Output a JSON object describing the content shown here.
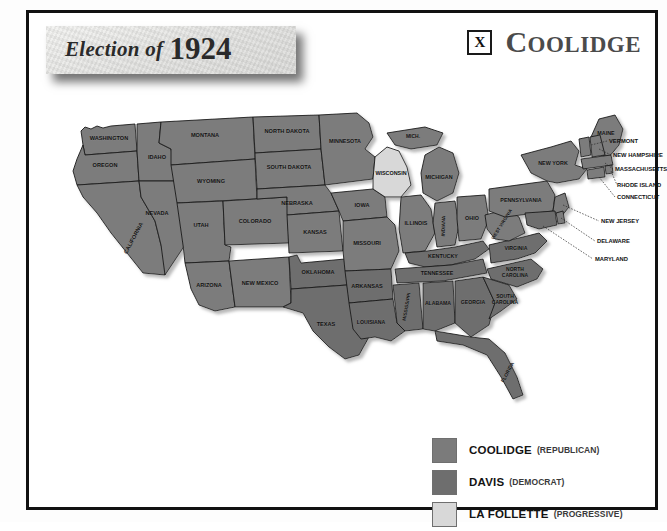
{
  "header": {
    "title_script": "Election of",
    "title_year": "1924",
    "winner_mark": "X",
    "winner_name": "Coolidge"
  },
  "legend": {
    "items": [
      {
        "name": "COOLIDGE",
        "party": "(REPUBLICAN)",
        "color": "#7b7b7b"
      },
      {
        "name": "DAVIS",
        "party": "(DEMOCRAT)",
        "color": "#6e6e6e"
      },
      {
        "name": "LA FOLLETTE",
        "party": "(PROGRESSIVE)",
        "color": "#d8d8d8"
      }
    ]
  },
  "map": {
    "colors": {
      "coolidge": "#7b7b7b",
      "davis": "#6e6e6e",
      "lafollette": "#d8d8d8",
      "border": "#1b1b1b",
      "shadow": "#bdbdbd"
    },
    "states": [
      {
        "id": "washington",
        "label": "WASHINGTON",
        "winner": "coolidge"
      },
      {
        "id": "oregon",
        "label": "OREGON",
        "winner": "coolidge"
      },
      {
        "id": "california",
        "label": "CALIFORNIA",
        "winner": "coolidge"
      },
      {
        "id": "idaho",
        "label": "IDAHO",
        "winner": "coolidge"
      },
      {
        "id": "nevada",
        "label": "NEVADA",
        "winner": "coolidge"
      },
      {
        "id": "montana",
        "label": "MONTANA",
        "winner": "coolidge"
      },
      {
        "id": "wyoming",
        "label": "WYOMING",
        "winner": "coolidge"
      },
      {
        "id": "utah",
        "label": "UTAH",
        "winner": "coolidge"
      },
      {
        "id": "arizona",
        "label": "ARIZONA",
        "winner": "coolidge"
      },
      {
        "id": "colorado",
        "label": "COLORADO",
        "winner": "coolidge"
      },
      {
        "id": "new-mexico",
        "label": "NEW MEXICO",
        "winner": "coolidge"
      },
      {
        "id": "north-dakota",
        "label": "NORTH DAKOTA",
        "winner": "coolidge"
      },
      {
        "id": "south-dakota",
        "label": "SOUTH DAKOTA",
        "winner": "coolidge"
      },
      {
        "id": "nebraska",
        "label": "NEBRASKA",
        "winner": "coolidge"
      },
      {
        "id": "kansas",
        "label": "KANSAS",
        "winner": "coolidge"
      },
      {
        "id": "oklahoma",
        "label": "OKLAHOMA",
        "winner": "davis"
      },
      {
        "id": "texas",
        "label": "TEXAS",
        "winner": "davis"
      },
      {
        "id": "minnesota",
        "label": "MINNESOTA",
        "winner": "coolidge"
      },
      {
        "id": "iowa",
        "label": "IOWA",
        "winner": "coolidge"
      },
      {
        "id": "missouri",
        "label": "MISSOURI",
        "winner": "coolidge"
      },
      {
        "id": "arkansas",
        "label": "ARKANSAS",
        "winner": "davis"
      },
      {
        "id": "louisiana",
        "label": "LOUISIANA",
        "winner": "davis"
      },
      {
        "id": "wisconsin",
        "label": "WISCONSIN",
        "winner": "lafollette"
      },
      {
        "id": "michigan-up",
        "label": "MICH.",
        "winner": "coolidge"
      },
      {
        "id": "michigan",
        "label": "MICHIGAN",
        "winner": "coolidge"
      },
      {
        "id": "illinois",
        "label": "ILLINOIS",
        "winner": "coolidge"
      },
      {
        "id": "indiana",
        "label": "INDIANA",
        "winner": "coolidge"
      },
      {
        "id": "ohio",
        "label": "OHIO",
        "winner": "coolidge"
      },
      {
        "id": "kentucky",
        "label": "KENTUCKY",
        "winner": "davis"
      },
      {
        "id": "tennessee",
        "label": "TENNESSEE",
        "winner": "davis"
      },
      {
        "id": "mississippi",
        "label": "MISSISSIPPI",
        "winner": "davis"
      },
      {
        "id": "alabama",
        "label": "ALABAMA",
        "winner": "davis"
      },
      {
        "id": "georgia",
        "label": "GEORGIA",
        "winner": "davis"
      },
      {
        "id": "florida",
        "label": "FLORIDA",
        "winner": "davis"
      },
      {
        "id": "south-carolina",
        "label": "SOUTH CAROLINA",
        "winner": "davis"
      },
      {
        "id": "north-carolina",
        "label": "NORTH CAROLINA",
        "winner": "davis"
      },
      {
        "id": "virginia",
        "label": "VIRGINIA",
        "winner": "davis"
      },
      {
        "id": "west-virginia",
        "label": "WEST VIRGINIA",
        "winner": "coolidge"
      },
      {
        "id": "pennsylvania",
        "label": "PENNSYLVANIA",
        "winner": "coolidge"
      },
      {
        "id": "new-york",
        "label": "NEW YORK",
        "winner": "coolidge"
      },
      {
        "id": "maine",
        "label": "MAINE",
        "winner": "coolidge"
      }
    ],
    "callouts": [
      {
        "id": "vermont",
        "label": "VERMONT",
        "winner": "coolidge"
      },
      {
        "id": "new-hampshire",
        "label": "NEW HAMPSHIRE",
        "winner": "coolidge"
      },
      {
        "id": "massachusetts",
        "label": "MASSACHUSETTS",
        "winner": "coolidge"
      },
      {
        "id": "rhode-island",
        "label": "RHODE ISLAND",
        "winner": "coolidge"
      },
      {
        "id": "connecticut",
        "label": "CONNECTICUT",
        "winner": "coolidge"
      },
      {
        "id": "new-jersey",
        "label": "NEW JERSEY",
        "winner": "coolidge"
      },
      {
        "id": "delaware",
        "label": "DELAWARE",
        "winner": "coolidge"
      },
      {
        "id": "maryland",
        "label": "MARYLAND",
        "winner": "davis"
      }
    ]
  }
}
